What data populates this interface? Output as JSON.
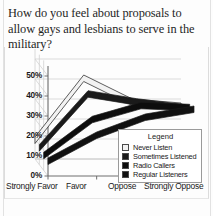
{
  "title": "How do you feel about proposals to allow gays and lesbians to serve in the military?",
  "legend": {
    "heading": "Legend",
    "entries": [
      {
        "label": "Never Listen",
        "color": "#f2f2f2"
      },
      {
        "label": "Sometimes Listened",
        "color": "#1a1a1a"
      },
      {
        "label": "Radio Callers",
        "color": "#0d0d0d"
      },
      {
        "label": "Regular Listeners",
        "color": "#111111"
      }
    ]
  },
  "chart_data": {
    "type": "line",
    "title": "How do you feel about proposals to allow gays and lesbians to serve in the military?",
    "xlabel": "",
    "ylabel": "",
    "categories": [
      "Strongly Favor",
      "Favor",
      "Oppose",
      "Strongly Oppose"
    ],
    "ytick_labels": [
      "0%",
      "10%",
      "20%",
      "30%",
      "40%",
      "50%"
    ],
    "ytick_values": [
      0,
      10,
      20,
      30,
      40,
      50
    ],
    "ylim": [
      0,
      55
    ],
    "grid": true,
    "legend_position": "inside-right",
    "projection": "3d",
    "series": [
      {
        "name": "Never Listen",
        "color": "#f2f2f2",
        "values": [
          11,
          42,
          30,
          28
        ]
      },
      {
        "name": "Sometimes Listened",
        "color": "#1a1a1a",
        "values": [
          10,
          37,
          33,
          30
        ]
      },
      {
        "name": "Radio Callers",
        "color": "#0d0d0d",
        "values": [
          9,
          27,
          34,
          33
        ]
      },
      {
        "name": "Regular Listeners",
        "color": "#111111",
        "values": [
          9,
          22,
          31,
          35
        ]
      }
    ]
  }
}
